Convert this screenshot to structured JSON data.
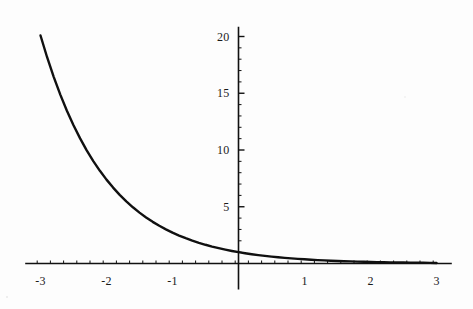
{
  "figure": {
    "background_color": "#fdfdfd",
    "ink_color": "#101010",
    "width": 473,
    "height": 309
  },
  "chart_data": {
    "type": "line",
    "title": "",
    "subtitle": "",
    "xlabel": "",
    "ylabel": "",
    "function": "y = e^(-x)",
    "xlim": [
      -3.05,
      3.05
    ],
    "ylim": [
      0,
      20.5
    ],
    "grid": false,
    "legend": null,
    "legend_position": "none",
    "axis_style": "mathematica-crossing-axes",
    "x_axis_value": 0,
    "y_axis_value": 0,
    "x_ticks_major": [
      -3,
      -2,
      -1,
      1,
      2,
      3
    ],
    "x_tick_labels": [
      "-3",
      "-2",
      "-1",
      "1",
      "2",
      "3"
    ],
    "x_ticks_minor_step": 0.2,
    "y_ticks_major": [
      5,
      10,
      15,
      20
    ],
    "y_tick_labels": [
      "5",
      "10",
      "15",
      "20"
    ],
    "y_ticks_minor_step": 1,
    "series": [
      {
        "name": "exp(-x)",
        "color": "#101010",
        "line_width": 2.4,
        "x": [
          -3.0,
          -2.9,
          -2.8,
          -2.7,
          -2.6,
          -2.5,
          -2.4,
          -2.3,
          -2.2,
          -2.1,
          -2.0,
          -1.9,
          -1.8,
          -1.7,
          -1.6,
          -1.5,
          -1.4,
          -1.3,
          -1.2,
          -1.1,
          -1.0,
          -0.9,
          -0.8,
          -0.7,
          -0.6,
          -0.5,
          -0.4,
          -0.3,
          -0.2,
          -0.1,
          0.0,
          0.1,
          0.2,
          0.3,
          0.4,
          0.5,
          0.6,
          0.7,
          0.8,
          0.9,
          1.0,
          1.1,
          1.2,
          1.3,
          1.4,
          1.5,
          1.6,
          1.7,
          1.8,
          1.9,
          2.0,
          2.1,
          2.2,
          2.3,
          2.4,
          2.5,
          2.6,
          2.7,
          2.8,
          2.9,
          3.0
        ],
        "y": [
          20.086,
          18.174,
          16.445,
          14.88,
          13.464,
          12.182,
          11.023,
          9.974,
          9.025,
          8.166,
          7.389,
          6.686,
          6.05,
          5.474,
          4.953,
          4.482,
          4.055,
          3.669,
          3.32,
          3.004,
          2.718,
          2.46,
          2.226,
          2.014,
          1.822,
          1.649,
          1.492,
          1.35,
          1.221,
          1.105,
          1.0,
          0.905,
          0.819,
          0.741,
          0.67,
          0.607,
          0.549,
          0.497,
          0.449,
          0.407,
          0.368,
          0.333,
          0.301,
          0.273,
          0.247,
          0.223,
          0.202,
          0.183,
          0.165,
          0.15,
          0.135,
          0.122,
          0.111,
          0.1,
          0.091,
          0.082,
          0.074,
          0.067,
          0.061,
          0.055,
          0.05
        ]
      }
    ]
  },
  "ticks": {
    "x": [
      {
        "label": "-3",
        "value": -3
      },
      {
        "label": "-2",
        "value": -2
      },
      {
        "label": "-1",
        "value": -1
      },
      {
        "label": "1",
        "value": 1
      },
      {
        "label": "2",
        "value": 2
      },
      {
        "label": "3",
        "value": 3
      }
    ],
    "y": [
      {
        "label": "5",
        "value": 5
      },
      {
        "label": "10",
        "value": 10
      },
      {
        "label": "15",
        "value": 15
      },
      {
        "label": "20",
        "value": 20
      }
    ]
  }
}
